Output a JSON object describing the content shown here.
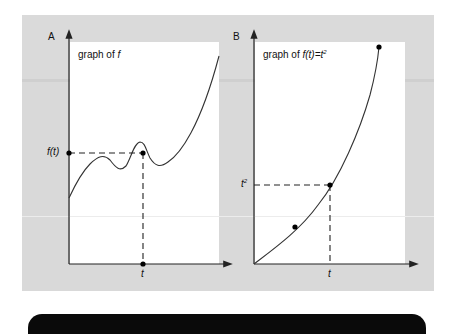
{
  "figure": {
    "panel_a": {
      "letter": "A",
      "title_prefix": "graph of ",
      "title_var": "f",
      "y_label": "f(t)",
      "x_label": "t"
    },
    "panel_b": {
      "letter": "B",
      "title_prefix": "graph of ",
      "title_func": "f(t)=t",
      "title_sup": "2",
      "y_label_base": "t",
      "y_label_sup": "2",
      "x_label": "t"
    }
  },
  "colors": {
    "background": "#d9d9d9",
    "plot_area": "#ffffff",
    "curve": "#333333",
    "axis": "#222222",
    "bottom_bar": "#0a0a0a"
  }
}
